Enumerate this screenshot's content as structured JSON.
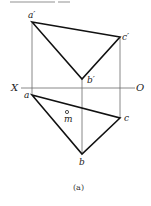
{
  "diagram": {
    "axis": {
      "left_label": "X",
      "right_label": "O"
    },
    "front_view": {
      "points": [
        {
          "name": "a'",
          "label": "a′"
        },
        {
          "name": "b'",
          "label": "b′"
        },
        {
          "name": "c'",
          "label": "c′"
        }
      ]
    },
    "top_view": {
      "points": [
        {
          "name": "a",
          "label": "a"
        },
        {
          "name": "b",
          "label": "b"
        },
        {
          "name": "c",
          "label": "c"
        },
        {
          "name": "m",
          "label": "m"
        }
      ]
    },
    "caption": "(a)"
  }
}
